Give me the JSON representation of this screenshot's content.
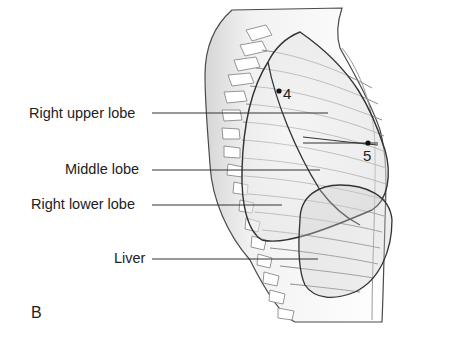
{
  "figure": {
    "panel_letter": "B",
    "view": "right lateral thorax",
    "labels": [
      {
        "id": "right-upper-lobe",
        "text": "Right upper lobe"
      },
      {
        "id": "middle-lobe",
        "text": "Middle lobe"
      },
      {
        "id": "right-lower-lobe",
        "text": "Right lower lobe"
      },
      {
        "id": "liver",
        "text": "Liver"
      }
    ],
    "markers": [
      {
        "id": "point-4",
        "text": "4"
      },
      {
        "id": "point-5",
        "text": "5"
      }
    ],
    "colors": {
      "outline": "#555555",
      "lobe_outline": "#333333",
      "shade": "#e4e4e4",
      "leader": "#333333"
    }
  }
}
